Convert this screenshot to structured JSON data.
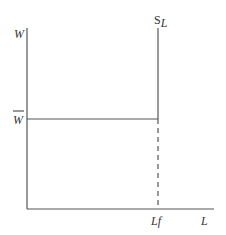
{
  "diagram": {
    "type": "labor-supply-diagram",
    "y_axis_label": "W",
    "x_axis_label": "L",
    "wage_level_label": "W",
    "wage_level_overline": true,
    "supply_curve_label_main": "S",
    "supply_curve_label_sub": "L",
    "full_employment_label": "Lf",
    "colors": {
      "axes": "#555555",
      "lines": "#555555",
      "text": "#333333",
      "background": "#ffffff"
    }
  }
}
